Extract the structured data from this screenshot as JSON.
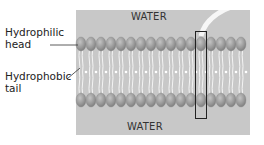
{
  "diagram": {
    "regions": {
      "top": "WATER",
      "bottom": "WATER"
    },
    "labels": {
      "head": "Hydrophilic head",
      "head_line1": "Hydrophilic",
      "head_line2": "head",
      "tail": "Hydrophobic tail",
      "tail_line1": "Hydrophobic",
      "tail_line2": "tail"
    },
    "colors": {
      "water": "#c8c8c8",
      "head": "#9a9a9a",
      "tail": "#ffffff",
      "highlight_box": "#222222"
    },
    "head_count_per_row": 17
  }
}
